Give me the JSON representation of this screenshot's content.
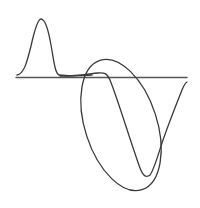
{
  "diagram": {
    "colors": {
      "background": "#ffffff",
      "stroke": "#3a3a3a",
      "baseline": "#555555"
    },
    "elements": [
      {
        "name": "baseline",
        "type": "line"
      },
      {
        "name": "gaussian-pulse",
        "type": "curve"
      },
      {
        "name": "waveform-trough",
        "type": "curve"
      },
      {
        "name": "highlight-ellipse",
        "type": "ellipse"
      }
    ]
  }
}
